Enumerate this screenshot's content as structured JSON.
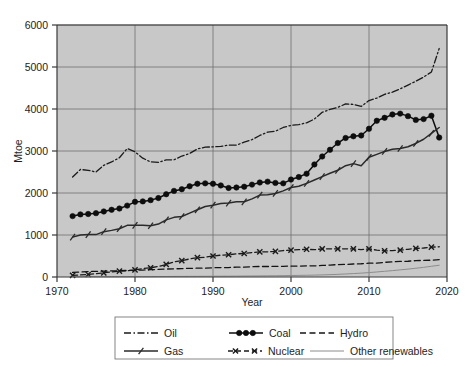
{
  "chart_data": {
    "type": "line",
    "title": "",
    "xlabel": "Year",
    "ylabel": "Mtoe",
    "xlim": [
      1970,
      2020
    ],
    "ylim": [
      0,
      6000
    ],
    "xticks": [
      1970,
      1980,
      1990,
      2000,
      2010,
      2020
    ],
    "ytick_labels": [
      "0",
      "1000",
      "2000",
      "3000",
      "4000",
      "5000",
      "6000"
    ],
    "yticks": [
      0,
      1000,
      2000,
      3000,
      4000,
      5000,
      6000
    ],
    "grid": true,
    "legend_position": "below-axes",
    "plot_background": "#c8c8c8",
    "x": [
      1972,
      1973,
      1974,
      1975,
      1976,
      1977,
      1978,
      1979,
      1980,
      1981,
      1982,
      1983,
      1984,
      1985,
      1986,
      1987,
      1988,
      1989,
      1990,
      1991,
      1992,
      1993,
      1994,
      1995,
      1996,
      1997,
      1998,
      1999,
      2000,
      2001,
      2002,
      2003,
      2004,
      2005,
      2006,
      2007,
      2008,
      2009,
      2010,
      2011,
      2012,
      2013,
      2014,
      2015,
      2016,
      2017,
      2018,
      2019
    ],
    "series": [
      {
        "name": "Oil",
        "style": "dash-dot",
        "marker": "none",
        "color": "#1a1a1a",
        "values": [
          2380,
          2560,
          2540,
          2500,
          2660,
          2740,
          2840,
          3060,
          2980,
          2830,
          2740,
          2730,
          2790,
          2790,
          2880,
          2940,
          3050,
          3090,
          3100,
          3110,
          3140,
          3140,
          3210,
          3270,
          3370,
          3450,
          3470,
          3560,
          3610,
          3630,
          3670,
          3760,
          3920,
          3990,
          4040,
          4120,
          4110,
          4060,
          4200,
          4260,
          4350,
          4400,
          4480,
          4570,
          4660,
          4760,
          4880,
          5440
        ]
      },
      {
        "name": "Coal",
        "style": "solid",
        "marker": "filled-circle",
        "color": "#0d0d0d",
        "values": [
          1450,
          1490,
          1500,
          1520,
          1560,
          1600,
          1630,
          1700,
          1790,
          1800,
          1830,
          1880,
          1970,
          2050,
          2090,
          2160,
          2220,
          2230,
          2220,
          2180,
          2120,
          2130,
          2150,
          2200,
          2250,
          2270,
          2240,
          2230,
          2320,
          2380,
          2460,
          2680,
          2870,
          3030,
          3190,
          3310,
          3350,
          3370,
          3530,
          3720,
          3790,
          3870,
          3890,
          3830,
          3740,
          3760,
          3840,
          3320
        ]
      },
      {
        "name": "Gas",
        "style": "solid",
        "marker": "slash",
        "color": "#2a2a2a",
        "values": [
          950,
          1000,
          1010,
          1010,
          1080,
          1110,
          1150,
          1230,
          1230,
          1230,
          1220,
          1260,
          1360,
          1420,
          1440,
          1520,
          1600,
          1680,
          1710,
          1750,
          1760,
          1790,
          1790,
          1860,
          1950,
          1960,
          1990,
          2050,
          2130,
          2160,
          2230,
          2310,
          2390,
          2470,
          2540,
          2650,
          2700,
          2650,
          2850,
          2920,
          2990,
          3040,
          3060,
          3100,
          3180,
          3280,
          3420,
          3560
        ]
      },
      {
        "name": "Nuclear",
        "style": "dash",
        "marker": "cross-x",
        "color": "#1a1a1a",
        "values": [
          40,
          50,
          60,
          80,
          100,
          120,
          140,
          150,
          170,
          200,
          220,
          250,
          300,
          360,
          390,
          430,
          460,
          470,
          500,
          520,
          530,
          550,
          560,
          580,
          600,
          600,
          610,
          630,
          640,
          650,
          660,
          650,
          670,
          670,
          670,
          670,
          670,
          650,
          670,
          640,
          620,
          630,
          640,
          660,
          680,
          690,
          710,
          720
        ]
      },
      {
        "name": "Hydro",
        "style": "dashed",
        "marker": "none",
        "color": "#141414",
        "values": [
          110,
          120,
          130,
          135,
          140,
          145,
          150,
          155,
          160,
          165,
          175,
          180,
          190,
          195,
          200,
          205,
          210,
          210,
          220,
          225,
          225,
          235,
          235,
          245,
          250,
          250,
          255,
          255,
          260,
          260,
          265,
          265,
          275,
          285,
          295,
          300,
          310,
          315,
          330,
          330,
          350,
          360,
          370,
          375,
          390,
          395,
          400,
          415
        ]
      },
      {
        "name": "Other renewables",
        "style": "thin-solid",
        "marker": "none",
        "color": "#8c8c8c",
        "values": [
          5,
          5,
          6,
          6,
          7,
          7,
          8,
          8,
          9,
          9,
          10,
          11,
          12,
          13,
          14,
          15,
          16,
          17,
          18,
          19,
          20,
          21,
          23,
          24,
          26,
          28,
          30,
          32,
          35,
          38,
          41,
          45,
          50,
          56,
          63,
          72,
          82,
          92,
          105,
          120,
          136,
          152,
          170,
          188,
          208,
          230,
          255,
          280
        ]
      }
    ]
  },
  "legend": {
    "entries": [
      {
        "label": "Oil"
      },
      {
        "label": "Coal"
      },
      {
        "label": "Hydro"
      },
      {
        "label": "Gas"
      },
      {
        "label": "Nuclear"
      },
      {
        "label": "Other renewables"
      }
    ]
  }
}
